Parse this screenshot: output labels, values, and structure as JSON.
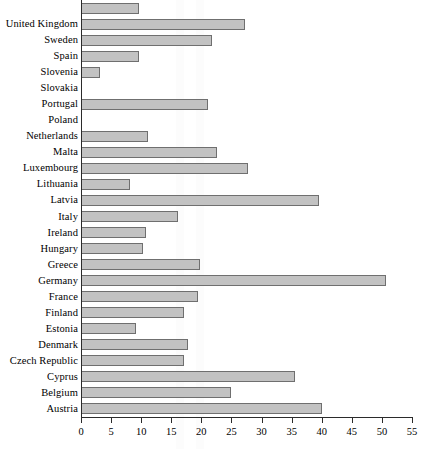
{
  "chart_data": {
    "type": "bar",
    "orientation": "horizontal",
    "title": "",
    "subtitle": "",
    "xlabel": "",
    "ylabel": "",
    "xlim": [
      0,
      55
    ],
    "xticks": [
      0,
      5,
      10,
      15,
      20,
      25,
      30,
      35,
      40,
      45,
      50,
      55
    ],
    "grid": false,
    "legend": null,
    "bar_fill_color": "#c2c2c2",
    "bar_border_color": "#6f6f6f",
    "axis_color": "#2b2b2b",
    "categories": [
      "",
      "United Kingdom",
      "Sweden",
      "Spain",
      "Slovenia",
      "Slovakia",
      "Portugal",
      "Poland",
      "Netherlands",
      "Malta",
      "Luxembourg",
      "Lithuania",
      "Latvia",
      "Italy",
      "Ireland",
      "Hungary",
      "Greece",
      "Germany",
      "France",
      "Finland",
      "Estonia",
      "Denmark",
      "Czech Republic",
      "Cyprus",
      "Belgium",
      "Austria"
    ],
    "values": [
      9.6,
      27.2,
      21.8,
      9.7,
      3.1,
      0,
      21.1,
      0,
      11.1,
      22.6,
      27.7,
      8.1,
      39.5,
      16.1,
      10.8,
      10.3,
      19.8,
      50.7,
      19.4,
      17.1,
      9.1,
      17.8,
      17.1,
      35.5,
      25.0,
      40.0
    ]
  }
}
